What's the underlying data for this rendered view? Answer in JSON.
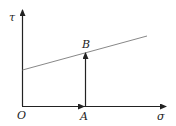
{
  "diagram": {
    "labels": {
      "y_axis": "τ",
      "x_axis": "σ",
      "origin": "O",
      "point_a": "A",
      "point_b": "B"
    },
    "colors": {
      "axis": "#222222",
      "line": "#888888",
      "background": "#ffffff"
    }
  }
}
